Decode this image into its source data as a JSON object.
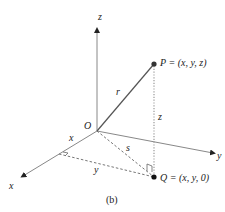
{
  "figure": {
    "caption": "(b)",
    "points": {
      "origin": {
        "label": "O"
      },
      "P": {
        "label": "P = (x, y, z)"
      },
      "Q": {
        "label": "Q = (x, y, 0)"
      }
    },
    "axes": {
      "x": "x",
      "y": "y",
      "z": "z"
    },
    "segments": {
      "r": "r",
      "s": "s",
      "z_height": "z",
      "x_len": "x",
      "y_len": "y"
    }
  }
}
